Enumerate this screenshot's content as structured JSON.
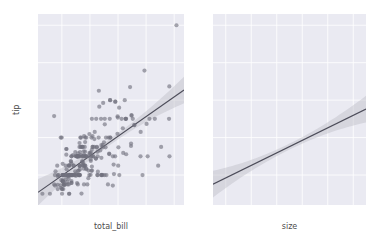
{
  "figure": {
    "width": 376,
    "height": 248,
    "background": "#ffffff",
    "panel_background": "#eaeaf2",
    "grid_color": "#ffffff",
    "point_color": "#6f6f7d",
    "line_color": "#4c4c59",
    "ci_color": "#b9b9c4",
    "style": "darkgrid"
  },
  "chart_data": [
    {
      "type": "scatter",
      "title": "",
      "xlabel": "total_bill",
      "ylabel": "tip",
      "xlim": [
        1.5,
        53.5
      ],
      "ylim": [
        0.4,
        10.6
      ],
      "xticks": [
        10,
        20,
        30,
        40,
        50
      ],
      "yticks": [
        2,
        4,
        6,
        8,
        10
      ],
      "grid": true,
      "legend": "none",
      "regression": {
        "shown": true,
        "slope": 0.105,
        "intercept": 0.92,
        "ci": 95
      },
      "x": [
        16.99,
        10.34,
        21.01,
        23.68,
        24.59,
        25.29,
        8.77,
        26.88,
        15.04,
        14.78,
        10.27,
        35.26,
        15.42,
        18.43,
        14.83,
        21.58,
        10.33,
        16.29,
        16.97,
        20.65,
        17.92,
        20.29,
        15.77,
        39.42,
        19.82,
        17.81,
        13.37,
        12.69,
        21.7,
        19.65,
        9.55,
        18.35,
        15.06,
        20.69,
        17.78,
        24.06,
        16.31,
        16.93,
        18.69,
        31.27,
        16.04,
        17.46,
        13.94,
        9.68,
        30.4,
        18.29,
        22.23,
        32.4,
        28.55,
        18.04,
        12.54,
        10.29,
        34.81,
        9.94,
        25.56,
        19.49,
        38.01,
        26.41,
        11.24,
        48.27,
        20.29,
        13.81,
        11.02,
        18.29,
        17.59,
        20.08,
        16.45,
        3.07,
        20.23,
        15.01,
        12.02,
        17.07,
        26.86,
        25.28,
        14.73,
        10.51,
        17.92,
        27.2,
        22.76,
        17.29,
        19.44,
        16.66,
        10.07,
        32.68,
        15.98,
        34.83,
        13.03,
        18.28,
        24.71,
        21.16,
        28.97,
        22.49,
        5.75,
        16.32,
        22.75,
        40.17,
        27.28,
        12.03,
        21.01,
        12.46,
        11.35,
        15.38,
        44.3,
        22.42,
        20.92,
        15.36,
        20.49,
        25.21,
        18.24,
        14.76,
        16.32,
        22.12,
        24.01,
        15.69,
        11.61,
        10.77,
        15.53,
        10.07,
        12.6,
        32.83,
        35.83,
        29.03,
        27.18,
        22.67,
        17.82,
        18.78,
        10.34,
        17.51,
        11.38,
        12.16,
        13.42,
        8.58,
        15.98,
        13.42,
        16.27,
        10.09,
        20.45,
        13.28,
        22.12,
        24.01,
        15.69,
        11.61,
        10.77,
        15.53,
        10.07,
        12.6,
        32.83,
        35.83,
        29.03,
        27.18,
        22.67,
        17.82,
        18.78,
        7.25,
        38.07,
        23.95,
        25.71,
        17.31,
        29.93,
        10.65,
        12.43,
        24.08,
        11.69,
        13.42,
        14.26,
        15.95,
        12.48,
        29.8,
        8.52,
        14.52,
        11.38,
        22.82,
        19.08,
        20.27,
        11.17,
        12.26,
        18.26,
        8.51,
        10.33,
        14.15,
        16.0,
        13.16,
        17.47,
        34.3,
        41.19,
        27.05,
        16.43,
        8.35,
        18.64,
        11.87,
        9.78,
        7.51,
        14.07,
        13.13,
        17.26,
        24.55,
        19.77,
        29.85,
        48.17,
        25.0,
        13.39,
        16.49,
        21.5,
        12.66,
        16.21,
        13.81,
        17.51,
        24.52,
        20.76,
        31.71,
        10.59,
        10.63,
        50.81,
        15.81,
        7.25,
        31.85,
        16.82,
        32.9,
        17.89,
        14.48,
        9.6,
        34.63,
        34.65,
        23.33,
        45.35,
        23.17,
        40.55,
        20.69,
        20.9,
        30.46,
        18.15,
        23.1,
        15.69,
        19.81,
        28.44,
        15.48,
        16.58,
        7.56,
        10.34,
        43.11,
        13.0,
        13.51,
        18.71,
        12.74,
        13.0,
        16.4,
        20.53,
        16.47,
        26.59,
        38.73,
        24.27,
        12.76,
        30.06,
        25.89,
        48.33,
        13.27,
        28.17,
        12.9,
        28.15,
        11.59,
        7.74,
        30.14,
        12.16,
        13.42,
        8.58,
        15.98,
        13.42,
        16.27,
        10.09
      ],
      "y": [
        1.01,
        1.66,
        3.5,
        3.31,
        3.61,
        4.71,
        2.0,
        3.12,
        1.96,
        3.23,
        1.71,
        5.0,
        1.57,
        3.0,
        3.02,
        3.92,
        1.67,
        3.71,
        3.5,
        3.35,
        4.08,
        2.75,
        2.23,
        7.58,
        3.18,
        2.34,
        2.0,
        2.0,
        4.3,
        3.0,
        1.45,
        2.5,
        3.0,
        2.45,
        3.27,
        3.6,
        2.0,
        3.07,
        2.31,
        5.0,
        2.24,
        2.54,
        3.06,
        1.32,
        5.6,
        3.0,
        5.0,
        6.0,
        2.05,
        3.0,
        2.5,
        2.6,
        5.2,
        4.0,
        3.48,
        2.24,
        3.0,
        1.5,
        1.76,
        6.73,
        3.21,
        2.0,
        1.98,
        3.76,
        2.64,
        3.15,
        2.47,
        1.0,
        2.01,
        2.09,
        1.97,
        3.0,
        3.14,
        5.0,
        2.2,
        1.25,
        3.08,
        4.0,
        3.0,
        2.71,
        1.83,
        3.5,
        1.0,
        5.0,
        2.03,
        5.17,
        2.0,
        4.0,
        5.85,
        3.0,
        3.0,
        3.5,
        1.0,
        2.5,
        3.25,
        4.73,
        4.0,
        1.5,
        3.0,
        1.5,
        2.5,
        3.0,
        2.5,
        3.48,
        4.08,
        3.0,
        2.23,
        2.0,
        2.5,
        2.0,
        3.0,
        2.88,
        2.0,
        3.0,
        3.39,
        1.47,
        3.0,
        1.25,
        1.0,
        5.0,
        4.67,
        5.92,
        6.0,
        2.0,
        2.5,
        3.0,
        2.0,
        3.0,
        2.0,
        2.0,
        1.58,
        1.92,
        3.0,
        3.0,
        3.5,
        2.0,
        3.0,
        2.72,
        2.88,
        2.0,
        3.0,
        3.39,
        1.47,
        3.0,
        1.25,
        1.0,
        5.0,
        4.67,
        5.92,
        6.0,
        2.0,
        2.5,
        3.0,
        5.15,
        4.3,
        5.0,
        4.0,
        3.5,
        5.07,
        1.5,
        1.8,
        2.92,
        2.31,
        1.68,
        2.5,
        2.0,
        2.52,
        4.2,
        1.48,
        2.0,
        2.0,
        2.18,
        1.5,
        2.83,
        1.5,
        2.0,
        3.25,
        1.25,
        2.0,
        2.0,
        2.0,
        2.75,
        3.5,
        6.7,
        5.0,
        5.0,
        2.3,
        2.5,
        2.36,
        1.63,
        1.73,
        2.0,
        2.5,
        2.0,
        2.74,
        2.0,
        2.0,
        5.14,
        5.0,
        3.75,
        2.61,
        2.0,
        3.5,
        2.5,
        2.0,
        2.0,
        3.0,
        3.48,
        2.24,
        4.5,
        1.61,
        2.0,
        10.0,
        3.16,
        1.5,
        3.18,
        4.0,
        3.11,
        1.5,
        2.0,
        4.0,
        3.55,
        3.68,
        5.65,
        3.5,
        6.5,
        3.0,
        5.0,
        3.5,
        2.0,
        3.5,
        4.0,
        1.5,
        4.19,
        2.56,
        2.02,
        4.0,
        1.44,
        2.0,
        5.0,
        2.0,
        2.0,
        4.0,
        2.01,
        2.0,
        2.5,
        4.0,
        3.23,
        4.0,
        2.0,
        2.01,
        2.0,
        2.5,
        2.0,
        3.0,
        2.0,
        3.0,
        2.0,
        1.44,
        3.09,
        2.2,
        3.48,
        1.92,
        1.58,
        2.0,
        3.0,
        3.0,
        2.0
      ],
      "n_points": 244
    },
    {
      "type": "scatter",
      "title": "",
      "xlabel": "size",
      "ylabel": "tip",
      "xlim": [
        0.5,
        6.5
      ],
      "ylim": [
        0.4,
        10.6
      ],
      "xticks": [
        1,
        2,
        3,
        4,
        5,
        6
      ],
      "yticks": [
        2,
        4,
        6,
        8,
        10
      ],
      "grid": true,
      "legend": "none",
      "regression": {
        "shown": true,
        "slope": 0.668,
        "intercept": 1.18,
        "ci": 95
      },
      "x": [
        2,
        3,
        3,
        2,
        4,
        4,
        2,
        4,
        2,
        2,
        2,
        4,
        2,
        4,
        2,
        2,
        3,
        3,
        3,
        3,
        2,
        2,
        2,
        4,
        2,
        4,
        2,
        2,
        2,
        2,
        2,
        3,
        2,
        3,
        2,
        3,
        3,
        3,
        3,
        3,
        3,
        2,
        2,
        2,
        4,
        2,
        2,
        4,
        2,
        2,
        2,
        2,
        4,
        2,
        4,
        2,
        4,
        3,
        2,
        4,
        2,
        2,
        2,
        2,
        3,
        3,
        2,
        1,
        2,
        2,
        2,
        3,
        2,
        2,
        2,
        2,
        2,
        4,
        2,
        2,
        2,
        2,
        1,
        2,
        2,
        4,
        2,
        2,
        2,
        2,
        2,
        2,
        2,
        2,
        2,
        4,
        2,
        2,
        3,
        2,
        2,
        2,
        3,
        2,
        2,
        2,
        2,
        2,
        2,
        2,
        2,
        2,
        4,
        2,
        2,
        2,
        2,
        2,
        2,
        2,
        3,
        3,
        2,
        2,
        2,
        2,
        2,
        2,
        2,
        2,
        2,
        2,
        2,
        2,
        3,
        2,
        2,
        4,
        2,
        2,
        2,
        2,
        2,
        2,
        2,
        4,
        2,
        2,
        2,
        2,
        2,
        1,
        3,
        2,
        4,
        2,
        4,
        2,
        2,
        4,
        2,
        2,
        2,
        2,
        2,
        4,
        2,
        2,
        2,
        2,
        2,
        2,
        2,
        2,
        2,
        2,
        2,
        2,
        2,
        2,
        3,
        3,
        6,
        4,
        2,
        3,
        2,
        2,
        2,
        2,
        2,
        2,
        2,
        3,
        2,
        5,
        6,
        2,
        2,
        2,
        4,
        2,
        2,
        2,
        2,
        4,
        2,
        3,
        2,
        2,
        3,
        2,
        2,
        3,
        2,
        2,
        2,
        2,
        4,
        2,
        4,
        4,
        4,
        2,
        2,
        5,
        6,
        2,
        4,
        2,
        3,
        2,
        2,
        2,
        2,
        2,
        2,
        2,
        2,
        4,
        4,
        2,
        4,
        2,
        2,
        2,
        2,
        2,
        2,
        3,
        2,
        2,
        2,
        2,
        2,
        2,
        2
      ],
      "n_points": 244
    }
  ]
}
